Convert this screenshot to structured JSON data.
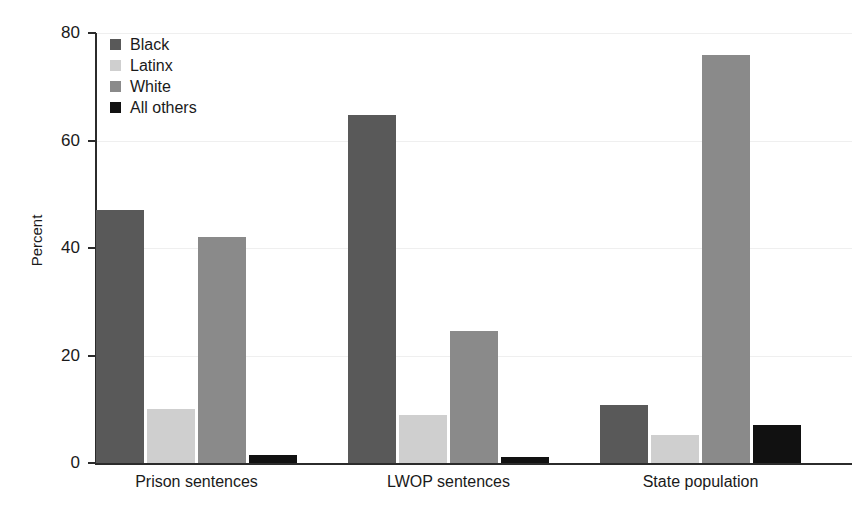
{
  "chart_data": {
    "type": "bar",
    "title": "",
    "xlabel": "",
    "ylabel": "Percent",
    "ylim": [
      0,
      80
    ],
    "yticks": [
      0,
      20,
      40,
      60,
      80
    ],
    "ytick_labels": [
      "0",
      "20",
      "40",
      "60",
      "80"
    ],
    "grid": true,
    "legend_position": "top-left",
    "categories": [
      "Prison sentences",
      "LWOP sentences",
      "State population"
    ],
    "series": [
      {
        "name": "Black",
        "color": "#595959",
        "values": [
          47.0,
          64.8,
          10.8
        ]
      },
      {
        "name": "Latinx",
        "color": "#cfcfcf",
        "values": [
          10.0,
          8.9,
          5.2
        ]
      },
      {
        "name": "White",
        "color": "#8a8a8a",
        "values": [
          42.0,
          24.5,
          75.9
        ]
      },
      {
        "name": "All others",
        "color": "#111111",
        "values": [
          1.4,
          1.2,
          7.1
        ]
      }
    ]
  },
  "axis": {
    "y_title": "Percent"
  },
  "legend": {
    "items": [
      {
        "label": "Black"
      },
      {
        "label": "Latinx"
      },
      {
        "label": "White"
      },
      {
        "label": "All others"
      }
    ]
  }
}
